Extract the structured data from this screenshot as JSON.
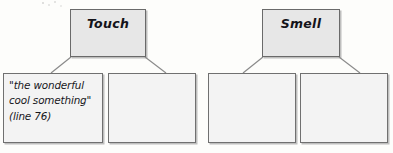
{
  "page": {
    "background_color": "#fdfdfb",
    "width": 393,
    "height": 153
  },
  "palette": {
    "header_fill": "#e7e7e7",
    "leaf_fill": "#f3f3f3",
    "border": "#6f6f6f",
    "connector": "#8a8a8a",
    "ink": "#17171c"
  },
  "diagrams": [
    {
      "id": "touch",
      "header": {
        "label": "Touch",
        "x": 70,
        "y": 9,
        "w": 76,
        "h": 48
      },
      "children": [
        {
          "id": "touch-evidence-1",
          "text": "\"the wonderful\ncool something\"\n(line 76)",
          "empty": false,
          "x": 3,
          "y": 73,
          "w": 100,
          "h": 70
        },
        {
          "id": "touch-evidence-2",
          "text": "",
          "empty": true,
          "x": 108,
          "y": 73,
          "w": 88,
          "h": 70
        }
      ]
    },
    {
      "id": "smell",
      "header": {
        "label": "Smell",
        "x": 262,
        "y": 9,
        "w": 78,
        "h": 48
      },
      "children": [
        {
          "id": "smell-evidence-1",
          "text": "",
          "empty": true,
          "x": 208,
          "y": 73,
          "w": 88,
          "h": 70
        },
        {
          "id": "smell-evidence-2",
          "text": "",
          "empty": true,
          "x": 300,
          "y": 73,
          "w": 88,
          "h": 70
        }
      ]
    }
  ]
}
